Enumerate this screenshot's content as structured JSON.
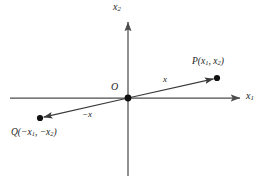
{
  "figure": {
    "background_color": "#ffffff",
    "line_color": "#4d4d4d",
    "text_color": "#1b1b1b",
    "point_color": "#111111"
  },
  "axes": {
    "x1_label": "x",
    "x1_label_sub": "1",
    "x2_label": "x",
    "x2_label_sub": "2",
    "origin_label": "O",
    "horizontal": {
      "x_start": 10,
      "x_end": 243,
      "y": 98
    },
    "vertical": {
      "y_start": 20,
      "y_end": 176,
      "x": 128
    }
  },
  "points": [
    {
      "id": "P",
      "label_prefix": "P(",
      "label_first": "x",
      "label_first_sub": "1",
      "label_sep": ", ",
      "label_second": "x",
      "label_second_sub": "2",
      "label_suffix": ")",
      "cx": 217,
      "cy": 78,
      "r": 3.1
    },
    {
      "id": "Q",
      "label_prefix": "Q(−",
      "label_first": "x",
      "label_first_sub": "1",
      "label_sep": ", −",
      "label_second": "x",
      "label_second_sub": "2",
      "label_suffix": ")",
      "cx": 40,
      "cy": 118,
      "r": 3.1
    }
  ],
  "vectors": [
    {
      "id": "x",
      "label": "x",
      "from_x": 128,
      "from_y": 98,
      "to_x": 217,
      "to_y": 78
    },
    {
      "id": "-x",
      "label": "−x",
      "from_x": 128,
      "from_y": 98,
      "to_x": 40,
      "to_y": 118
    }
  ],
  "origin_dot": {
    "cx": 128,
    "cy": 98,
    "r": 3.4
  }
}
